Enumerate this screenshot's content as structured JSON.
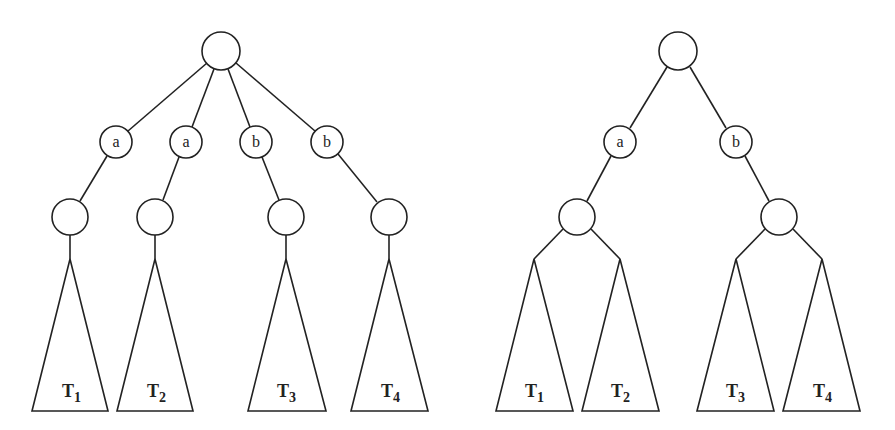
{
  "diagram": {
    "stroke_color": "#222222",
    "background": "#ffffff",
    "trees": [
      {
        "name": "left-tree",
        "root": {
          "label": "",
          "cx": 221,
          "cy": 51,
          "r": 19
        },
        "edge_nodes": [
          {
            "label": "a",
            "cx": 116,
            "cy": 142,
            "r": 16
          },
          {
            "label": "a",
            "cx": 186,
            "cy": 142,
            "r": 16
          },
          {
            "label": "b",
            "cx": 256,
            "cy": 142,
            "r": 16
          },
          {
            "label": "b",
            "cx": 327,
            "cy": 142,
            "r": 16
          }
        ],
        "child_nodes": [
          {
            "label": "",
            "cx": 70,
            "cy": 217,
            "r": 18
          },
          {
            "label": "",
            "cx": 155,
            "cy": 217,
            "r": 18
          },
          {
            "label": "",
            "cx": 286,
            "cy": 217,
            "r": 18
          },
          {
            "label": "",
            "cx": 389,
            "cy": 217,
            "r": 18
          }
        ],
        "subtrees": [
          {
            "label": "T",
            "sub": "1",
            "apex_x": 70,
            "left": 32,
            "right": 108
          },
          {
            "label": "T",
            "sub": "2",
            "apex_x": 155,
            "left": 117,
            "right": 193
          },
          {
            "label": "T",
            "sub": "3",
            "apex_x": 286,
            "left": 248,
            "right": 326
          },
          {
            "label": "T",
            "sub": "4",
            "apex_x": 389,
            "left": 351,
            "right": 428
          }
        ]
      },
      {
        "name": "right-tree",
        "root": {
          "label": "",
          "cx": 678,
          "cy": 51,
          "r": 19
        },
        "edge_nodes": [
          {
            "label": "a",
            "cx": 620,
            "cy": 142,
            "r": 16
          },
          {
            "label": "b",
            "cx": 736,
            "cy": 142,
            "r": 16
          }
        ],
        "child_nodes": [
          {
            "label": "",
            "cx": 577,
            "cy": 217,
            "r": 18
          },
          {
            "label": "",
            "cx": 779,
            "cy": 217,
            "r": 18
          }
        ],
        "subtrees": [
          {
            "label": "T",
            "sub": "1",
            "apex_x": 534,
            "left": 496,
            "right": 573
          },
          {
            "label": "T",
            "sub": "2",
            "apex_x": 620,
            "left": 582,
            "right": 659
          },
          {
            "label": "T",
            "sub": "3",
            "apex_x": 736,
            "left": 697,
            "right": 774
          },
          {
            "label": "T",
            "sub": "4",
            "apex_x": 822,
            "left": 783,
            "right": 860
          }
        ]
      }
    ],
    "apex_y": 259,
    "base_y": 411
  }
}
